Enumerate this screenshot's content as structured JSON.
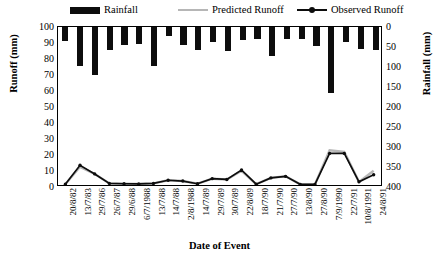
{
  "legend": {
    "rainfall": "Rainfall",
    "predicted": "Predicted Runoff",
    "observed": "Observed Runoff"
  },
  "axes": {
    "left_title": "Runoff (mm)",
    "right_title": "Rainfall (mm)",
    "x_title": "Date of Event",
    "left_ticks": [
      "0",
      "10",
      "20",
      "30",
      "40",
      "50",
      "60",
      "70",
      "80",
      "90",
      "100"
    ],
    "right_ticks": [
      "0",
      "50",
      "100",
      "150",
      "200",
      "250",
      "300",
      "350",
      "400"
    ]
  },
  "colors": {
    "bar": "#0d0d0d",
    "observed": "#0d0d0d",
    "predicted": "#b6b6b6",
    "axis": "#000000",
    "background": "#ffffff"
  },
  "chart_data": {
    "type": "bar",
    "title": "",
    "xlabel": "Date of Event",
    "ylabel": "Runoff (mm)",
    "y2label": "Rainfall (mm)",
    "ylim": [
      0,
      100
    ],
    "y2lim": [
      0,
      400
    ],
    "y2_inverted": true,
    "grid": false,
    "legend_position": "top",
    "categories": [
      "20/8/82",
      "13/7/83",
      "29/7/86",
      "26/7/87",
      "29/6/88",
      "6/7/1988",
      "13/7/88",
      "14/7/88",
      "2/8/1988",
      "14/7/89",
      "29/7/89",
      "30/7/89",
      "22/8/89",
      "18/7/90",
      "21/7/90",
      "27/7/90",
      "13/8/90",
      "27/8/90",
      "7/9/1990",
      "22/7/91",
      "10/8/1991",
      "24/8/91"
    ],
    "series": [
      {
        "name": "Rainfall",
        "axis": "y2",
        "type": "bar",
        "values": [
          36,
          98,
          120,
          57,
          46,
          42,
          98,
          22,
          45,
          57,
          37,
          60,
          33,
          30,
          72,
          31,
          29,
          47,
          165,
          38,
          54,
          57
        ]
      },
      {
        "name": "Observed Runoff",
        "axis": "y1",
        "type": "line",
        "values": [
          0.5,
          12.5,
          7.0,
          1.0,
          0.8,
          0.7,
          1.0,
          3.0,
          2.5,
          0.8,
          4.0,
          3.5,
          9.5,
          0.5,
          4.5,
          5.5,
          0.4,
          0.4,
          20.0,
          20.0,
          2.0,
          6.5
        ]
      },
      {
        "name": "Predicted Runoff",
        "axis": "y1",
        "type": "line",
        "values": [
          0.5,
          11.5,
          7.0,
          1.0,
          0.8,
          0.7,
          1.0,
          3.0,
          2.5,
          0.8,
          4.0,
          3.5,
          9.0,
          0.5,
          4.5,
          5.5,
          0.4,
          0.4,
          22.0,
          21.0,
          2.0,
          9.0
        ]
      }
    ]
  }
}
